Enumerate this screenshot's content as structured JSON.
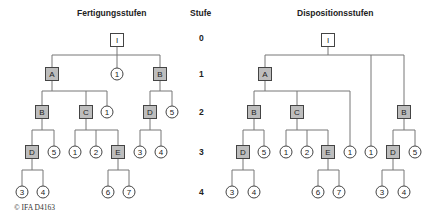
{
  "titles": {
    "left": "Fertigungsstufen",
    "stufe": "Stufe",
    "right": "Dispositionsstufen"
  },
  "levels": [
    "0",
    "1",
    "2",
    "3",
    "4"
  ],
  "copyright": "© IFA D4163",
  "colors": {
    "line": "#777777",
    "box_fill": "#bdbdbd",
    "box_stroke": "#444444",
    "root_fill": "#ffffff",
    "circle_stroke": "#444444"
  },
  "left_tree": {
    "nodes": [
      {
        "id": "I",
        "type": "root",
        "label": "I",
        "x": 117,
        "y": 40
      },
      {
        "id": "A",
        "type": "box",
        "label": "A",
        "x": 52,
        "y": 74
      },
      {
        "id": "c1a",
        "type": "circle",
        "label": "1",
        "x": 117,
        "y": 74
      },
      {
        "id": "B1",
        "type": "box",
        "label": "B",
        "x": 160,
        "y": 74
      },
      {
        "id": "B2",
        "type": "box",
        "label": "B",
        "x": 42,
        "y": 112
      },
      {
        "id": "C",
        "type": "box",
        "label": "C",
        "x": 86,
        "y": 112
      },
      {
        "id": "c1b",
        "type": "circle",
        "label": "1",
        "x": 107,
        "y": 112
      },
      {
        "id": "D2",
        "type": "box",
        "label": "D",
        "x": 150,
        "y": 112
      },
      {
        "id": "c5a",
        "type": "circle",
        "label": "5",
        "x": 172,
        "y": 112
      },
      {
        "id": "D3",
        "type": "box",
        "label": "D",
        "x": 32,
        "y": 152
      },
      {
        "id": "c5b",
        "type": "circle",
        "label": "5",
        "x": 54,
        "y": 152
      },
      {
        "id": "c1c",
        "type": "circle",
        "label": "1",
        "x": 75,
        "y": 152
      },
      {
        "id": "c2",
        "type": "circle",
        "label": "2",
        "x": 96,
        "y": 152
      },
      {
        "id": "E",
        "type": "box",
        "label": "E",
        "x": 118,
        "y": 152
      },
      {
        "id": "c3a",
        "type": "circle",
        "label": "3",
        "x": 140,
        "y": 152
      },
      {
        "id": "c4a",
        "type": "circle",
        "label": "4",
        "x": 161,
        "y": 152
      },
      {
        "id": "c3b",
        "type": "circle",
        "label": "3",
        "x": 22,
        "y": 192
      },
      {
        "id": "c4b",
        "type": "circle",
        "label": "4",
        "x": 43,
        "y": 192
      },
      {
        "id": "c6",
        "type": "circle",
        "label": "6",
        "x": 108,
        "y": 192
      },
      {
        "id": "c7",
        "type": "circle",
        "label": "7",
        "x": 129,
        "y": 192
      }
    ],
    "edges": [
      [
        "I",
        "A"
      ],
      [
        "I",
        "c1a"
      ],
      [
        "I",
        "B1"
      ],
      [
        "A",
        "B2"
      ],
      [
        "A",
        "C"
      ],
      [
        "A",
        "c1b"
      ],
      [
        "B1",
        "D2"
      ],
      [
        "B1",
        "c5a"
      ],
      [
        "B2",
        "D3"
      ],
      [
        "B2",
        "c5b"
      ],
      [
        "C",
        "c1c"
      ],
      [
        "C",
        "c2"
      ],
      [
        "C",
        "E"
      ],
      [
        "D2",
        "c3a"
      ],
      [
        "D2",
        "c4a"
      ],
      [
        "D3",
        "c3b"
      ],
      [
        "D3",
        "c4b"
      ],
      [
        "E",
        "c6"
      ],
      [
        "E",
        "c7"
      ]
    ]
  },
  "right_tree": {
    "nodes": [
      {
        "id": "I",
        "type": "root",
        "label": "I",
        "x": 328,
        "y": 40
      },
      {
        "id": "A",
        "type": "box",
        "label": "A",
        "x": 265,
        "y": 74
      },
      {
        "id": "B2",
        "type": "box",
        "label": "B",
        "x": 254,
        "y": 112
      },
      {
        "id": "C",
        "type": "box",
        "label": "C",
        "x": 297,
        "y": 112
      },
      {
        "id": "B1",
        "type": "box",
        "label": "B",
        "x": 404,
        "y": 112
      },
      {
        "id": "D3",
        "type": "box",
        "label": "D",
        "x": 243,
        "y": 152
      },
      {
        "id": "c5b",
        "type": "circle",
        "label": "5",
        "x": 264,
        "y": 152
      },
      {
        "id": "c1c",
        "type": "circle",
        "label": "1",
        "x": 286,
        "y": 152
      },
      {
        "id": "c2",
        "type": "circle",
        "label": "2",
        "x": 307,
        "y": 152
      },
      {
        "id": "E",
        "type": "box",
        "label": "E",
        "x": 328,
        "y": 152
      },
      {
        "id": "c1b",
        "type": "circle",
        "label": "1",
        "x": 350,
        "y": 152
      },
      {
        "id": "c1a",
        "type": "circle",
        "label": "1",
        "x": 371,
        "y": 152
      },
      {
        "id": "D2",
        "type": "box",
        "label": "D",
        "x": 393,
        "y": 152
      },
      {
        "id": "c5a",
        "type": "circle",
        "label": "5",
        "x": 415,
        "y": 152
      },
      {
        "id": "c3b",
        "type": "circle",
        "label": "3",
        "x": 232,
        "y": 192
      },
      {
        "id": "c4b",
        "type": "circle",
        "label": "4",
        "x": 254,
        "y": 192
      },
      {
        "id": "c6",
        "type": "circle",
        "label": "6",
        "x": 318,
        "y": 192
      },
      {
        "id": "c7",
        "type": "circle",
        "label": "7",
        "x": 339,
        "y": 192
      },
      {
        "id": "c3a",
        "type": "circle",
        "label": "3",
        "x": 382,
        "y": 192
      },
      {
        "id": "c4a",
        "type": "circle",
        "label": "4",
        "x": 404,
        "y": 192
      }
    ],
    "edges": [
      [
        "I",
        "A"
      ],
      [
        "I",
        "c1a"
      ],
      [
        "I",
        "B1"
      ],
      [
        "A",
        "B2"
      ],
      [
        "A",
        "C"
      ],
      [
        "A",
        "c1b"
      ],
      [
        "B1",
        "D2"
      ],
      [
        "B1",
        "c5a"
      ],
      [
        "B2",
        "D3"
      ],
      [
        "B2",
        "c5b"
      ],
      [
        "C",
        "c1c"
      ],
      [
        "C",
        "c2"
      ],
      [
        "C",
        "E"
      ],
      [
        "D2",
        "c3a"
      ],
      [
        "D2",
        "c4a"
      ],
      [
        "D3",
        "c3b"
      ],
      [
        "D3",
        "c4b"
      ],
      [
        "E",
        "c6"
      ],
      [
        "E",
        "c7"
      ]
    ]
  }
}
